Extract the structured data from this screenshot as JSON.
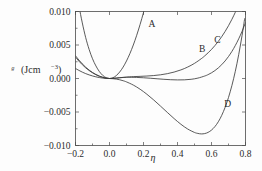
{
  "chart_data": {
    "type": "line",
    "title": "",
    "xlabel": "η",
    "ylabel": "ᵍ (Jcm−3)",
    "ylabel_main": "ᵍ",
    "ylabel_unit_base": "(Jcm",
    "ylabel_unit_exp": "−3",
    "ylabel_unit_close": ")",
    "xlim": [
      -0.2,
      0.8
    ],
    "ylim": [
      -0.01,
      0.01
    ],
    "grid": false,
    "legend": "inline-curve-labels",
    "xticks": [
      -0.2,
      0.0,
      0.2,
      0.4,
      0.6,
      0.8
    ],
    "xtick_labels": [
      "−0.2",
      "0.0",
      "0.2",
      "0.4",
      "0.6",
      "0.8"
    ],
    "yticks": [
      -0.01,
      -0.005,
      0.0,
      0.005,
      0.01
    ],
    "ytick_labels": [
      "−0.010",
      "−0.005",
      "0.000",
      "0.005",
      "0.010"
    ],
    "series": [
      {
        "name": "A",
        "label": "A",
        "label_x": 0.25,
        "label_y": 0.0077,
        "points": [
          [
            -0.2,
            0.014
          ],
          [
            -0.18,
            0.0109
          ],
          [
            -0.16,
            0.0083
          ],
          [
            -0.14,
            0.0061
          ],
          [
            -0.12,
            0.00435
          ],
          [
            -0.1,
            0.00295
          ],
          [
            -0.08,
            0.00188
          ],
          [
            -0.06,
            0.00105
          ],
          [
            -0.04,
            0.00047
          ],
          [
            -0.02,
            0.00012
          ],
          [
            0.0,
            0.0
          ],
          [
            0.02,
            0.00011
          ],
          [
            0.04,
            0.00044
          ],
          [
            0.06,
            0.00097
          ],
          [
            0.08,
            0.0017
          ],
          [
            0.1,
            0.00262
          ],
          [
            0.12,
            0.00372
          ],
          [
            0.14,
            0.005
          ],
          [
            0.16,
            0.00645
          ],
          [
            0.18,
            0.00807
          ],
          [
            0.2,
            0.00985
          ],
          [
            0.22,
            0.0118
          ]
        ]
      },
      {
        "name": "B",
        "label": "B",
        "label_x": 0.545,
        "label_y": 0.004,
        "points": [
          [
            -0.2,
            0.0034
          ],
          [
            -0.18,
            0.00276
          ],
          [
            -0.16,
            0.00219
          ],
          [
            -0.14,
            0.00169
          ],
          [
            -0.12,
            0.00126
          ],
          [
            -0.1,
            0.0009
          ],
          [
            -0.08,
            0.0006
          ],
          [
            -0.06,
            0.00036
          ],
          [
            -0.04,
            0.00018
          ],
          [
            -0.02,
            5e-05
          ],
          [
            0.0,
            0.0
          ],
          [
            0.02,
            2e-05
          ],
          [
            0.04,
            6e-05
          ],
          [
            0.06,
            0.00011
          ],
          [
            0.08,
            0.00015
          ],
          [
            0.1,
            0.00017
          ],
          [
            0.12,
            0.00018
          ],
          [
            0.16,
            0.00016
          ],
          [
            0.2,
            0.00011
          ],
          [
            0.24,
            4e-05
          ],
          [
            0.28,
            -4e-05
          ],
          [
            0.32,
            -0.00012
          ],
          [
            0.36,
            -0.00018
          ],
          [
            0.4,
            -0.00021
          ],
          [
            0.44,
            -0.0002
          ],
          [
            0.48,
            -0.00012
          ],
          [
            0.52,
            6e-05
          ],
          [
            0.56,
            0.00037
          ],
          [
            0.58,
            0.00058
          ],
          [
            0.6,
            0.00085
          ],
          [
            0.62,
            0.00118
          ],
          [
            0.64,
            0.00158
          ],
          [
            0.66,
            0.00206
          ],
          [
            0.68,
            0.00262
          ],
          [
            0.7,
            0.00328
          ],
          [
            0.72,
            0.00404
          ],
          [
            0.74,
            0.00492
          ],
          [
            0.76,
            0.00592
          ],
          [
            0.78,
            0.00705
          ],
          [
            0.8,
            0.00833
          ]
        ]
      },
      {
        "name": "C",
        "label": "C",
        "label_x": 0.635,
        "label_y": 0.0053,
        "points": [
          [
            -0.2,
            0.0032
          ],
          [
            -0.18,
            0.00259
          ],
          [
            -0.16,
            0.00206
          ],
          [
            -0.14,
            0.00159
          ],
          [
            -0.12,
            0.00119
          ],
          [
            -0.1,
            0.00085
          ],
          [
            -0.08,
            0.00057
          ],
          [
            -0.06,
            0.00034
          ],
          [
            -0.04,
            0.00017
          ],
          [
            -0.02,
            5e-05
          ],
          [
            0.0,
            0.0
          ],
          [
            0.02,
            2e-05
          ],
          [
            0.04,
            6e-05
          ],
          [
            0.06,
            0.00012
          ],
          [
            0.08,
            0.00017
          ],
          [
            0.1,
            0.00022
          ],
          [
            0.14,
            0.00028
          ],
          [
            0.18,
            0.00032
          ],
          [
            0.22,
            0.00037
          ],
          [
            0.26,
            0.00044
          ],
          [
            0.3,
            0.00055
          ],
          [
            0.34,
            0.00072
          ],
          [
            0.38,
            0.00096
          ],
          [
            0.42,
            0.00128
          ],
          [
            0.46,
            0.00171
          ],
          [
            0.5,
            0.00226
          ],
          [
            0.54,
            0.00296
          ],
          [
            0.56,
            0.00337
          ],
          [
            0.58,
            0.00383
          ],
          [
            0.6,
            0.00434
          ],
          [
            0.62,
            0.00491
          ],
          [
            0.64,
            0.00554
          ],
          [
            0.66,
            0.00624
          ],
          [
            0.68,
            0.00702
          ],
          [
            0.7,
            0.00788
          ],
          [
            0.72,
            0.00883
          ],
          [
            0.74,
            0.00988
          ],
          [
            0.755,
            0.01074
          ]
        ]
      },
      {
        "name": "D",
        "label": "D",
        "label_x": 0.695,
        "label_y": -0.0042,
        "points": [
          [
            -0.2,
            0.0015
          ],
          [
            -0.18,
            0.00121
          ],
          [
            -0.16,
            0.00095
          ],
          [
            -0.14,
            0.00073
          ],
          [
            -0.12,
            0.00054
          ],
          [
            -0.1,
            0.00038
          ],
          [
            -0.08,
            0.00025
          ],
          [
            -0.06,
            0.00014
          ],
          [
            -0.04,
            6e-05
          ],
          [
            -0.02,
            1e-05
          ],
          [
            0.0,
            0.0
          ],
          [
            0.02,
            -3e-05
          ],
          [
            0.04,
            -9e-05
          ],
          [
            0.06,
            -0.00019
          ],
          [
            0.08,
            -0.00033
          ],
          [
            0.1,
            -0.00051
          ],
          [
            0.14,
            -0.00098
          ],
          [
            0.18,
            -0.0016
          ],
          [
            0.22,
            -0.00235
          ],
          [
            0.26,
            -0.0032
          ],
          [
            0.3,
            -0.00412
          ],
          [
            0.34,
            -0.00506
          ],
          [
            0.38,
            -0.00598
          ],
          [
            0.42,
            -0.00683
          ],
          [
            0.46,
            -0.00754
          ],
          [
            0.5,
            -0.00805
          ],
          [
            0.52,
            -0.0082
          ],
          [
            0.54,
            -0.00827
          ],
          [
            0.56,
            -0.00822
          ],
          [
            0.58,
            -0.00804
          ],
          [
            0.6,
            -0.0077
          ],
          [
            0.62,
            -0.00718
          ],
          [
            0.64,
            -0.00646
          ],
          [
            0.66,
            -0.00551
          ],
          [
            0.68,
            -0.00431
          ],
          [
            0.7,
            -0.00283
          ],
          [
            0.72,
            -0.00105
          ],
          [
            0.74,
            0.00107
          ],
          [
            0.76,
            0.00356
          ],
          [
            0.78,
            0.00645
          ],
          [
            0.795,
            0.00893
          ]
        ]
      }
    ]
  },
  "figure": {
    "xlabel_glyph": "η"
  }
}
